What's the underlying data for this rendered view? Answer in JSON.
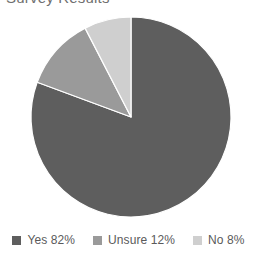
{
  "title": {
    "text": "Survey Results",
    "cropped": true
  },
  "chart_data": {
    "type": "pie",
    "title": "Survey Results",
    "xlabel": "",
    "ylabel": "",
    "categories": [
      "Yes",
      "Unsure",
      "No"
    ],
    "values": [
      82,
      12,
      8
    ],
    "value_unit": "%",
    "start_angle_deg": 0,
    "direction": "clockwise",
    "grid": false,
    "legend_position": "bottom",
    "slices": [
      {
        "label": "Yes",
        "value": 82,
        "display": "Yes 82%",
        "color": "#5e5e5e",
        "start_deg": 0,
        "end_deg": 290.3
      },
      {
        "label": "Unsure",
        "value": 12,
        "display": "Unsure 12%",
        "color": "#9a9a9a",
        "start_deg": 290.3,
        "end_deg": 332.7
      },
      {
        "label": "No",
        "value": 8,
        "display": "No 8%",
        "color": "#cfcfcf",
        "start_deg": 332.7,
        "end_deg": 360
      }
    ],
    "geometry": {
      "center_x": 131,
      "center_y": 117,
      "radius": 100,
      "separator_color": "#ffffff",
      "separator_width": 1.2
    }
  },
  "legend": {
    "items": [
      {
        "label": "Yes 82%",
        "color": "#5e5e5e"
      },
      {
        "label": "Unsure 12%",
        "color": "#9a9a9a"
      },
      {
        "label": "No 8%",
        "color": "#cfcfcf"
      }
    ]
  },
  "colors": {
    "background": "#ffffff",
    "text": "#5a5a5a",
    "yes": "#5e5e5e",
    "unsure": "#9a9a9a",
    "no": "#cfcfcf"
  }
}
